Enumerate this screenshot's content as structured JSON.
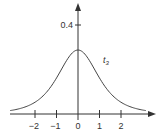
{
  "chart_data": {
    "type": "line",
    "title": "",
    "xlabel": "",
    "ylabel": "",
    "series": [
      {
        "name": "t3",
        "description": "Student t distribution density, 3 degrees of freedom",
        "x": [
          -2.7,
          -2,
          -1.5,
          -1,
          -0.5,
          0,
          0.5,
          1,
          1.5,
          2,
          2.7
        ],
        "values": [
          0.019,
          0.068,
          0.124,
          0.207,
          0.313,
          0.368,
          0.313,
          0.207,
          0.124,
          0.068,
          0.019
        ]
      }
    ],
    "x_ticks": [
      "−2",
      "−1",
      "0",
      "1",
      "2"
    ],
    "y_ticks": [
      "0.4"
    ],
    "xlim": [
      -3,
      3.5
    ],
    "ylim": [
      0,
      0.5
    ],
    "grid": false,
    "legend": "none",
    "annotations": [
      {
        "text": "t",
        "subscript": "3",
        "x": 1.1,
        "y": 0.3
      }
    ]
  },
  "labels": {
    "y_tick_04": "0.4",
    "x_ticks": [
      "−2",
      "−1",
      "0",
      "1",
      "2"
    ],
    "curve_label_main": "t",
    "curve_label_sub": "3"
  },
  "colors": {
    "axis": "#333333",
    "curve": "#444444"
  }
}
